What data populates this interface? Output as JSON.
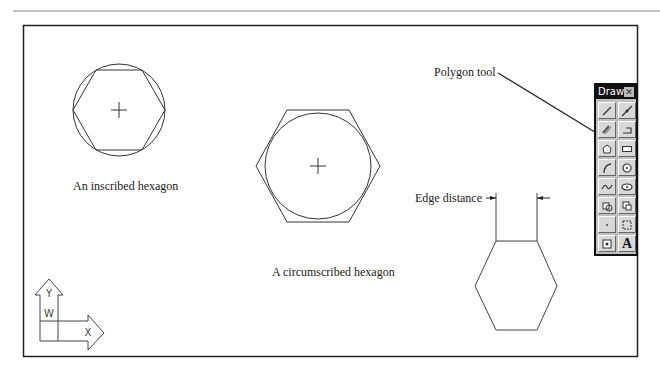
{
  "labels": {
    "inscribed": "An inscribed hexagon",
    "circumscribed": "A circumscribed hexagon",
    "edge_distance": "Edge distance",
    "polygon_tool": "Polygon tool"
  },
  "toolbar": {
    "title": "Draw",
    "close_glyph": "✕",
    "tools": [
      {
        "name": "line",
        "icon": "line-icon"
      },
      {
        "name": "construction-line",
        "icon": "construction-line-icon"
      },
      {
        "name": "multiline",
        "icon": "multiline-icon"
      },
      {
        "name": "polyline",
        "icon": "polyline-icon"
      },
      {
        "name": "polygon",
        "icon": "polygon-icon"
      },
      {
        "name": "rectangle",
        "icon": "rectangle-icon"
      },
      {
        "name": "arc",
        "icon": "arc-icon"
      },
      {
        "name": "circle",
        "icon": "circle-icon"
      },
      {
        "name": "spline",
        "icon": "spline-icon"
      },
      {
        "name": "ellipse",
        "icon": "ellipse-icon"
      },
      {
        "name": "insert-block",
        "icon": "insert-block-icon"
      },
      {
        "name": "make-block",
        "icon": "make-block-icon"
      },
      {
        "name": "point",
        "icon": "point-icon"
      },
      {
        "name": "hatch",
        "icon": "hatch-icon"
      },
      {
        "name": "region",
        "icon": "region-icon"
      },
      {
        "name": "multiline-text",
        "icon": "text-icon",
        "glyph": "A"
      }
    ]
  },
  "ucs_icon": {
    "x_label": "X",
    "y_label": "Y",
    "w_label": "W"
  }
}
